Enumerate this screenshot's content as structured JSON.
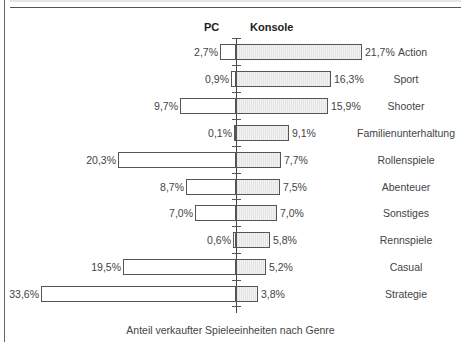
{
  "chart_data": {
    "type": "bar",
    "orientation": "horizontal-diverging",
    "title": "",
    "xlabel": "Anteil verkaufter Spieleeinheiten nach Genre",
    "ylabel": "",
    "legend": [
      "PC",
      "Konsole"
    ],
    "categories": [
      "Action",
      "Sport",
      "Shooter",
      "Familienunterhaltung",
      "Rollenspiele",
      "Abenteuer",
      "Sonstiges",
      "Rennspiele",
      "Casual",
      "Strategie"
    ],
    "series": [
      {
        "name": "PC",
        "values": [
          2.7,
          0.9,
          9.7,
          0.1,
          20.3,
          8.7,
          7.0,
          0.6,
          19.5,
          33.6
        ],
        "labels": [
          "2,7%",
          "0,9%",
          "9,7%",
          "0,1%",
          "20,3%",
          "8,7%",
          "7,0%",
          "0,6%",
          "19,5%",
          "33,6%"
        ]
      },
      {
        "name": "Konsole",
        "values": [
          21.7,
          16.3,
          15.9,
          9.1,
          7.7,
          7.5,
          7.0,
          5.8,
          5.2,
          3.8
        ],
        "labels": [
          "21,7%",
          "16,3%",
          "15,9%",
          "9,1%",
          "7,7%",
          "7,5%",
          "7,0%",
          "5,8%",
          "5,2%",
          "3,8%"
        ]
      }
    ],
    "unit": "%",
    "grid": false
  },
  "header": {
    "pc": "PC",
    "konsole": "Konsole"
  },
  "caption": "Anteil verkaufter Spieleeinheiten nach Genre"
}
